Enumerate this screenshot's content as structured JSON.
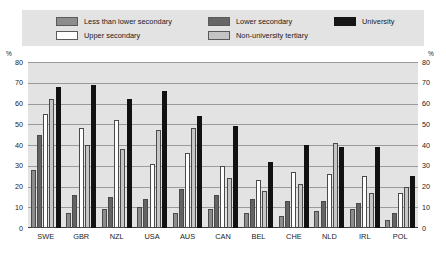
{
  "legend": {
    "items": [
      {
        "label": "Less than lower secondary",
        "color": "#8c8c8c",
        "key": "less"
      },
      {
        "label": "Upper secondary",
        "color": "#ffffff",
        "key": "upper"
      },
      {
        "label": "Lower secondary",
        "color": "#666666",
        "key": "lower"
      },
      {
        "label": "Non-university tertiary",
        "color": "#c4c4c4",
        "key": "nonuniv"
      },
      {
        "label": "University",
        "color": "#161616",
        "key": "univ"
      }
    ]
  },
  "axis": {
    "unit_left": "%",
    "unit_right": "%",
    "ticks": [
      "80",
      "70",
      "60",
      "50",
      "40",
      "30",
      "20",
      "10",
      "0"
    ]
  },
  "chart_data": {
    "type": "bar",
    "title": "",
    "xlabel": "",
    "ylabel": "%",
    "ylim": [
      0,
      80
    ],
    "ytick_step": 10,
    "grid": true,
    "legend_position": "top",
    "categories": [
      "SWE",
      "GBR",
      "NZL",
      "USA",
      "AUS",
      "CAN",
      "BEL",
      "CHE",
      "NLD",
      "IRL",
      "POL"
    ],
    "series": [
      {
        "name": "Less than lower secondary",
        "color": "#8c8c8c",
        "values": [
          28,
          7,
          9,
          10,
          7,
          9,
          7,
          6,
          8,
          9,
          4
        ]
      },
      {
        "name": "Lower secondary",
        "color": "#636363",
        "values": [
          45,
          16,
          15,
          14,
          19,
          16,
          14,
          13,
          13,
          12,
          7
        ]
      },
      {
        "name": "Upper secondary",
        "color": "#ffffff",
        "values": [
          55,
          48,
          52,
          31,
          36,
          30,
          23,
          27,
          26,
          25,
          17
        ]
      },
      {
        "name": "Non-university tertiary",
        "color": "#c6c6c6",
        "values": [
          62,
          40,
          38,
          47,
          48,
          24,
          18,
          21,
          41,
          17,
          20
        ]
      },
      {
        "name": "University",
        "color": "#121212",
        "values": [
          68,
          69,
          62,
          66,
          54,
          49,
          32,
          40,
          39,
          39,
          25
        ]
      }
    ]
  }
}
